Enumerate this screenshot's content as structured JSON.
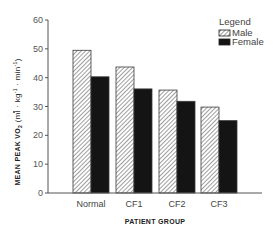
{
  "chart_data": {
    "type": "bar",
    "title": "",
    "xlabel": "PATIENT GROUP",
    "ylabel": "MEAN PEAK VO2 (ml · kg-1 · min-1)",
    "ylabel_parts": {
      "main": "MEAN PEAK V",
      "dot": "˙",
      "o": "O",
      "sub": "2",
      "units": "(ml · kg",
      "exp1": "-1",
      "mid": " · min",
      "exp2": "-1",
      "close": ")"
    },
    "ylim": [
      0,
      60
    ],
    "yticks": [
      0,
      10,
      20,
      30,
      40,
      50,
      60
    ],
    "categories": [
      "Normal",
      "CF1",
      "CF2",
      "CF3"
    ],
    "series": [
      {
        "name": "Male",
        "pattern": "hatched",
        "values": [
          49.5,
          43.7,
          35.7,
          29.8
        ]
      },
      {
        "name": "Female",
        "pattern": "solid-black",
        "values": [
          40.3,
          36.1,
          31.8,
          25.1
        ]
      }
    ],
    "legend": {
      "title": "Legend",
      "position": "top-right",
      "entries": [
        "Male",
        "Female"
      ]
    },
    "grid": false
  },
  "colors": {
    "axis": "#555555",
    "female": "#141414",
    "male_hatch": "#7a7a7a",
    "background": "#ffffff"
  }
}
